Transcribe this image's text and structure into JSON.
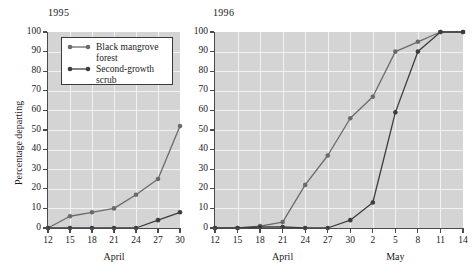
{
  "figure": {
    "ylabel": "Percentage departing",
    "y_ticks": [
      "100",
      "90",
      "80",
      "70",
      "60",
      "50",
      "40",
      "30",
      "20",
      "10",
      "0"
    ],
    "ylim": [
      0,
      100
    ],
    "colors": {
      "mangrove": "#6b6b6b",
      "scrub": "#3d3d3d",
      "plot_bg": "#d4d4d4",
      "grid": "#f2f2f2",
      "axis": "#4a4a4a"
    }
  },
  "legend": {
    "entries": [
      {
        "label_line1": "Black mangrove",
        "label_line2": "forest",
        "series": "mangrove"
      },
      {
        "label_line1": "Second-growth",
        "label_line2": "scrub",
        "series": "scrub"
      }
    ]
  },
  "chart_data": [
    {
      "type": "line",
      "title": "1995",
      "xlabel": "April",
      "ylabel": "Percentage departing",
      "ylim": [
        0,
        100
      ],
      "grid": true,
      "legend_position": "top-left-inset",
      "x": [
        12,
        15,
        18,
        21,
        24,
        27,
        30
      ],
      "tick_labels": [
        "12",
        "15",
        "18",
        "21",
        "24",
        "27",
        "30"
      ],
      "month_labels": [
        {
          "text": "April",
          "at": 21
        }
      ],
      "series": [
        {
          "name": "Black mangrove forest",
          "values": [
            0,
            6,
            8,
            10,
            17,
            25,
            52
          ]
        },
        {
          "name": "Second-growth scrub",
          "values": [
            0,
            0,
            0,
            0,
            0,
            4,
            8
          ]
        }
      ]
    },
    {
      "type": "line",
      "title": "1996",
      "xlabel": "April / May",
      "ylabel": "Percentage departing",
      "ylim": [
        0,
        100
      ],
      "grid": true,
      "legend_position": "none",
      "x": [
        12,
        15,
        18,
        21,
        24,
        27,
        30,
        33,
        36,
        39,
        42,
        45
      ],
      "tick_labels": [
        "12",
        "15",
        "18",
        "21",
        "24",
        "27",
        "30",
        "2",
        "5",
        "8",
        "11",
        "14"
      ],
      "month_labels": [
        {
          "text": "April",
          "at": 21
        },
        {
          "text": "May",
          "at": 36
        }
      ],
      "series": [
        {
          "name": "Black mangrove forest",
          "values": [
            0,
            0,
            1,
            3,
            22,
            37,
            56,
            67,
            90,
            95,
            100,
            100
          ]
        },
        {
          "name": "Second-growth scrub",
          "values": [
            0,
            0,
            0.5,
            0.5,
            0,
            0,
            4,
            13,
            59,
            90,
            100,
            100
          ]
        }
      ]
    }
  ]
}
